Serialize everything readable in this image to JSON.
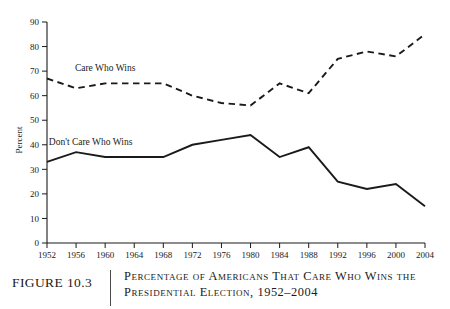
{
  "figure": {
    "number_label": "FIGURE 10.3",
    "caption_line_1": "Percentage of Americans That Care Who Wins the",
    "caption_line_2": "Presidential Election, 1952–2004"
  },
  "chart_data": {
    "type": "line",
    "title": "",
    "xlabel": "",
    "ylabel": "Percent",
    "ylim": [
      0,
      90
    ],
    "ytick_step": 10,
    "grid": false,
    "legend": "inline-labels",
    "categories": [
      "1952",
      "1956",
      "1960",
      "1964",
      "1968",
      "1972",
      "1976",
      "1980",
      "1984",
      "1988",
      "1992",
      "1996",
      "2000",
      "2004"
    ],
    "yticks": [
      "0",
      "10",
      "20",
      "30",
      "40",
      "50",
      "60",
      "70",
      "80",
      "90"
    ],
    "series": [
      {
        "name": "Care Who Wins",
        "style": "dashed",
        "values": [
          67,
          63,
          65,
          65,
          65,
          60,
          57,
          56,
          65,
          61,
          75,
          78,
          76,
          85
        ]
      },
      {
        "name": "Don't Care Who Wins",
        "style": "solid",
        "values": [
          33,
          37,
          35,
          35,
          35,
          40,
          42,
          44,
          35,
          39,
          25,
          22,
          24,
          15
        ]
      }
    ],
    "annotations": [
      {
        "text": "Care Who Wins",
        "x_year": "1960",
        "y_value": 70
      },
      {
        "text": "Don't Care Who Wins",
        "x_year": "1958",
        "y_value": 40
      }
    ]
  },
  "colors": {
    "ink": "#1a1a1a",
    "paper": "#ffffff"
  }
}
